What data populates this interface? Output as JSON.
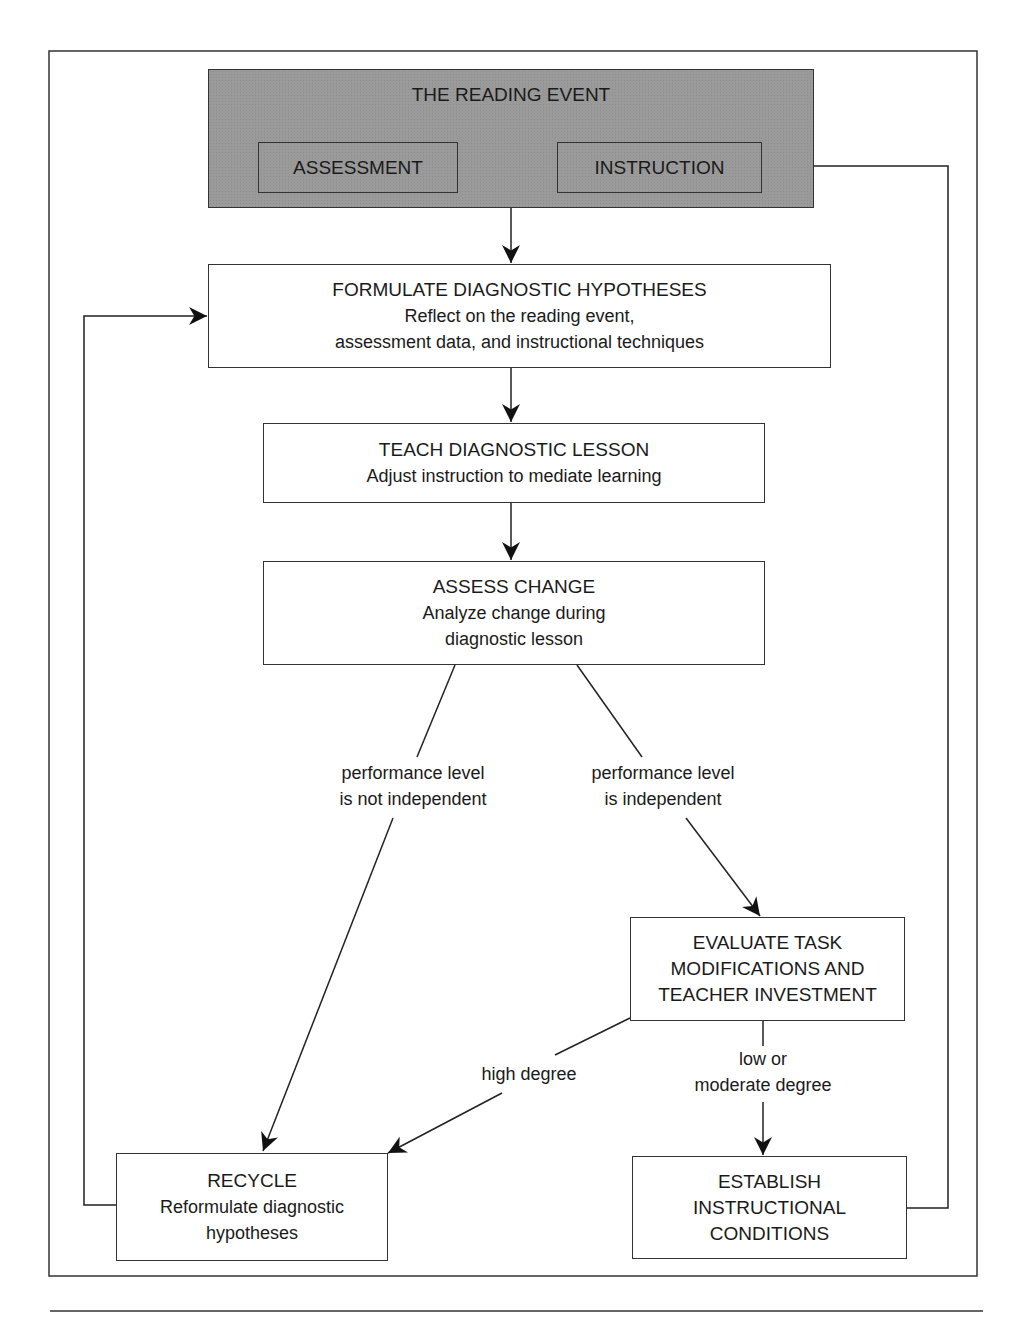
{
  "diagram": {
    "reading_event": {
      "title": "THE READING EVENT",
      "assessment": "ASSESSMENT",
      "instruction": "INSTRUCTION"
    },
    "formulate": {
      "title": "FORMULATE DIAGNOSTIC HYPOTHESES",
      "line1": "Reflect on the reading event,",
      "line2": "assessment data, and instructional techniques"
    },
    "teach": {
      "title": "TEACH DIAGNOSTIC LESSON",
      "line1": "Adjust instruction to mediate learning"
    },
    "assess_change": {
      "title": "ASSESS CHANGE",
      "line1": "Analyze change during",
      "line2": "diagnostic lesson"
    },
    "branch_not_independent": {
      "line1": "performance level",
      "line2": "is not independent"
    },
    "branch_independent": {
      "line1": "performance level",
      "line2": "is independent"
    },
    "evaluate": {
      "line1": "EVALUATE TASK",
      "line2": "MODIFICATIONS AND",
      "line3": "TEACHER INVESTMENT"
    },
    "branch_high": {
      "line1": "high degree"
    },
    "branch_low": {
      "line1": "low or",
      "line2": "moderate degree"
    },
    "recycle": {
      "title": "RECYCLE",
      "line1": "Reformulate diagnostic",
      "line2": "hypotheses"
    },
    "establish": {
      "line1": "ESTABLISH",
      "line2": "INSTRUCTIONAL",
      "line3": "CONDITIONS"
    }
  },
  "colors": {
    "line": "#333333",
    "header_fill": "#9a9a9a",
    "box_fill": "#ffffff"
  }
}
